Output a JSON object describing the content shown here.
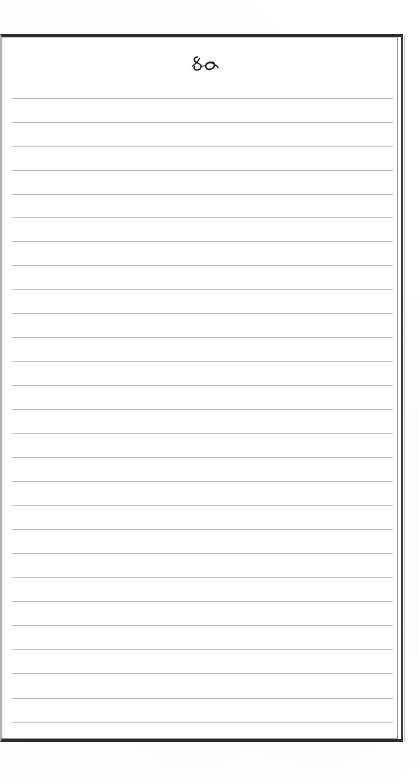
{
  "document": {
    "type": "scanned-page",
    "title": "Blank ruled notebook page",
    "body_text": "",
    "page_background": "#fefefe",
    "sheet_background": "#ffffff"
  },
  "frame": {
    "style": "double-rule",
    "outer_color": "#2b2b2b",
    "inner_color": "#9a9a9a",
    "left": 0,
    "top": 34,
    "width": 403,
    "height": 708
  },
  "header": {
    "ornament_name": "calligraphic-flourish",
    "ornament_description": "small handwritten script swash with loop and trailing curl",
    "ornament_color": "#1d1d1d",
    "ornament_center_x": 200,
    "ornament_center_y": 61
  },
  "ruling": {
    "line_color": "#b9bcc2",
    "first_line_y": 98,
    "spacing": 23.9,
    "line_count": 27,
    "line_left": 12,
    "line_right": 393,
    "lines": [
      {
        "index": 1,
        "y": 98,
        "content": ""
      },
      {
        "index": 2,
        "y": 122,
        "content": ""
      },
      {
        "index": 3,
        "y": 146,
        "content": ""
      },
      {
        "index": 4,
        "y": 170,
        "content": ""
      },
      {
        "index": 5,
        "y": 194,
        "content": ""
      },
      {
        "index": 6,
        "y": 217,
        "content": ""
      },
      {
        "index": 7,
        "y": 241,
        "content": ""
      },
      {
        "index": 8,
        "y": 265,
        "content": ""
      },
      {
        "index": 9,
        "y": 289,
        "content": ""
      },
      {
        "index": 10,
        "y": 313,
        "content": ""
      },
      {
        "index": 11,
        "y": 337,
        "content": ""
      },
      {
        "index": 12,
        "y": 361,
        "content": ""
      },
      {
        "index": 13,
        "y": 385,
        "content": ""
      },
      {
        "index": 14,
        "y": 409,
        "content": ""
      },
      {
        "index": 15,
        "y": 433,
        "content": ""
      },
      {
        "index": 16,
        "y": 457,
        "content": ""
      },
      {
        "index": 17,
        "y": 481,
        "content": ""
      },
      {
        "index": 18,
        "y": 505,
        "content": ""
      },
      {
        "index": 19,
        "y": 529,
        "content": ""
      },
      {
        "index": 20,
        "y": 553,
        "content": ""
      },
      {
        "index": 21,
        "y": 577,
        "content": ""
      },
      {
        "index": 22,
        "y": 601,
        "content": ""
      },
      {
        "index": 23,
        "y": 625,
        "content": ""
      },
      {
        "index": 24,
        "y": 649,
        "content": ""
      },
      {
        "index": 25,
        "y": 673,
        "content": ""
      },
      {
        "index": 26,
        "y": 698,
        "content": ""
      },
      {
        "index": 27,
        "y": 722,
        "content": ""
      }
    ]
  }
}
